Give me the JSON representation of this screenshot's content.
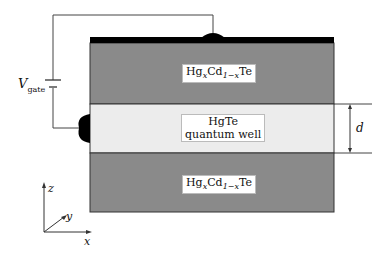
{
  "diagram": {
    "type": "HgTe quantum well heterostructure with gate",
    "layers": [
      {
        "name": "top-barrier",
        "label_main": "Hg",
        "label_sub1": "x",
        "label_mid": "Cd",
        "label_sub2": "1−x",
        "label_end": "Te",
        "color": "#8a8a8a"
      },
      {
        "name": "quantum-well",
        "label_line1": "HgTe",
        "label_line2": "quantum well",
        "color": "#ececec"
      },
      {
        "name": "bottom-barrier",
        "label_main": "Hg",
        "label_sub1": "x",
        "label_mid": "Cd",
        "label_sub2": "1−x",
        "label_end": "Te",
        "color": "#8a8a8a"
      }
    ],
    "gate_electrode_color": "#000000",
    "voltage_source": {
      "symbol": "V",
      "subscript": "gate"
    },
    "thickness_label": "d",
    "axes": {
      "z": "z",
      "y": "y",
      "x": "x"
    }
  }
}
